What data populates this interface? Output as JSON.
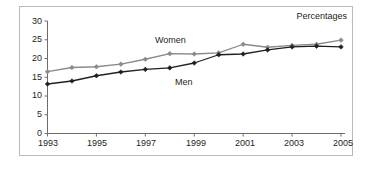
{
  "chart_data": {
    "type": "line",
    "title": "",
    "subtitle": "",
    "units_note": "Percentages",
    "xlabel": "",
    "ylabel": "",
    "xlim": [
      1993,
      2005
    ],
    "ylim": [
      0,
      30
    ],
    "y_ticks": [
      0,
      5,
      10,
      15,
      20,
      25,
      30
    ],
    "y_tick_labels": [
      "0",
      "5",
      "10",
      "15",
      "20",
      "25",
      "30"
    ],
    "x_ticks": [
      1993,
      1994,
      1995,
      1996,
      1997,
      1998,
      1999,
      2000,
      2001,
      2002,
      2003,
      2004,
      2005
    ],
    "x_tick_labels_shown": [
      "1993",
      "1995",
      "1997",
      "1999",
      "2001",
      "2003",
      "2005"
    ],
    "x": [
      1993,
      1994,
      1995,
      1996,
      1997,
      1998,
      1999,
      2000,
      2001,
      2002,
      2003,
      2004,
      2005
    ],
    "grid": false,
    "legend": "inline-labels",
    "marker": "diamond",
    "series": [
      {
        "name": "Women",
        "color": "#8a8a8a",
        "label_position": "above-line",
        "values": [
          16.5,
          17.6,
          17.8,
          18.5,
          19.8,
          21.3,
          21.2,
          21.5,
          23.8,
          23.0,
          23.5,
          23.8,
          24.9
        ]
      },
      {
        "name": "Men",
        "color": "#231f20",
        "label_position": "below-line",
        "values": [
          13.2,
          14.0,
          15.4,
          16.4,
          17.1,
          17.5,
          18.8,
          21.0,
          21.2,
          22.3,
          23.1,
          23.3,
          23.1
        ]
      }
    ]
  },
  "labels": {
    "women": "Women",
    "men": "Men",
    "percentages": "Percentages"
  },
  "colors": {
    "women_line": "#8a8a8a",
    "men_line": "#231f20",
    "axis": "#6d6d6d",
    "frame": "#b9b9b9",
    "text": "#231f20",
    "background": "#ffffff"
  }
}
